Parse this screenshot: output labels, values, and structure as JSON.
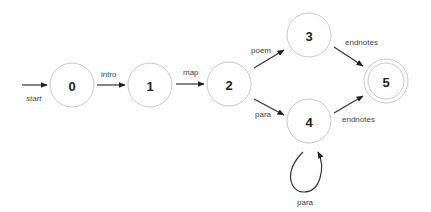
{
  "diagram": {
    "type": "finite-state-automaton",
    "start_label": "start",
    "nodes": [
      {
        "id": "0",
        "label": "0",
        "accepting": false
      },
      {
        "id": "1",
        "label": "1",
        "accepting": false
      },
      {
        "id": "2",
        "label": "2",
        "accepting": false
      },
      {
        "id": "3",
        "label": "3",
        "accepting": false
      },
      {
        "id": "4",
        "label": "4",
        "accepting": false
      },
      {
        "id": "5",
        "label": "5",
        "accepting": true
      }
    ],
    "edges": [
      {
        "from": "0",
        "to": "1",
        "label": "intro"
      },
      {
        "from": "1",
        "to": "2",
        "label": "map"
      },
      {
        "from": "2",
        "to": "3",
        "label": "poem"
      },
      {
        "from": "2",
        "to": "4",
        "label": "para"
      },
      {
        "from": "3",
        "to": "5",
        "label": "endnotes"
      },
      {
        "from": "4",
        "to": "5",
        "label": "endnotes"
      },
      {
        "from": "4",
        "to": "4",
        "label": "para"
      }
    ]
  }
}
